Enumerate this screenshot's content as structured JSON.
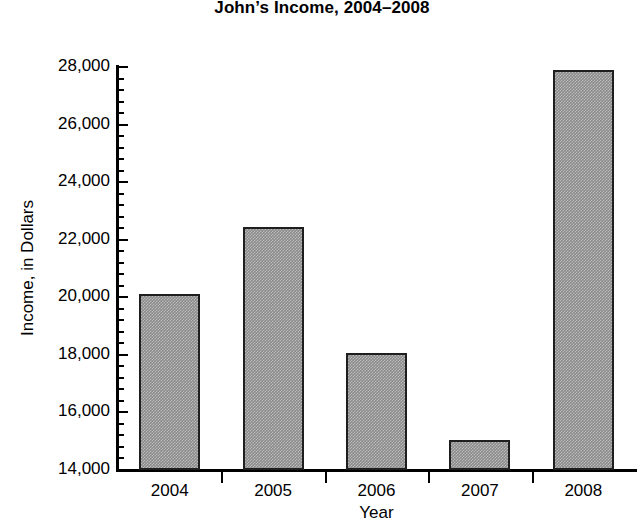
{
  "chart_data": {
    "type": "bar",
    "title": "John’s Income, 2004–2008",
    "xlabel": "Year",
    "ylabel": "Income, in Dollars",
    "categories": [
      "2004",
      "2005",
      "2006",
      "2007",
      "2008"
    ],
    "values": [
      20100,
      22450,
      18050,
      15050,
      27900
    ],
    "ylim": [
      14000,
      28000
    ],
    "ytick_labels": [
      "28,000",
      "26,000",
      "24,000",
      "22,000",
      "20,000",
      "18,000",
      "16,000",
      "14,000"
    ],
    "ytick_values": [
      28000,
      26000,
      24000,
      22000,
      20000,
      18000,
      16000,
      14000
    ],
    "ytick_step": 2000,
    "minor_ticks_per_interval": 4,
    "grid": false,
    "legend": null,
    "bar_fill_color": "#8a8a8a",
    "bar_border_color": "#1e1e1e",
    "axis_color": "#000000",
    "background_color": "#ffffff"
  }
}
